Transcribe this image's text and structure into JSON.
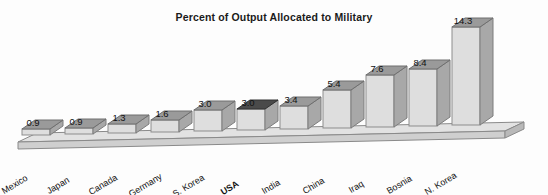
{
  "chart_data": {
    "type": "bar",
    "title": "Percent of Output Allocated to Military",
    "xlabel": "",
    "ylabel": "",
    "ylim": [
      0,
      14.3
    ],
    "grid": false,
    "legend": "none",
    "style": "3d-bar",
    "categories": [
      "Mexico",
      "Japan",
      "Canada",
      "Germany",
      "S. Korea",
      "USA",
      "India",
      "China",
      "Iraq",
      "Bosnia",
      "N. Korea"
    ],
    "values": [
      0.9,
      0.9,
      1.3,
      1.6,
      3.0,
      3.0,
      3.4,
      5.4,
      7.6,
      8.4,
      14.3
    ],
    "value_labels": [
      "0.9",
      "0.9",
      "1.3",
      "1.6",
      "3.0",
      "3.0",
      "3.4",
      "5.4",
      "7.6",
      "8.4",
      "14.3"
    ],
    "highlighted_category": "USA",
    "colors": {
      "bar_front": "#dcdcdc",
      "bar_side": "#a8a8a8",
      "bar_top": "#9a9a9a",
      "bar_top_highlight": "#4a4a4a",
      "base": "#d8d8d8",
      "text": "#111111",
      "background": "#fdfdfd"
    }
  },
  "bars": [
    {
      "label": "Mexico",
      "value_label": "0.9",
      "left": 22,
      "top": 129,
      "w": 28,
      "h": 6,
      "lx": 30,
      "ly": 117,
      "clx": 5,
      "cly": 186
    },
    {
      "label": "Japan",
      "value_label": "0.9",
      "left": 65,
      "top": 128,
      "w": 28,
      "h": 6,
      "lx": 73,
      "ly": 116,
      "clx": 50,
      "cly": 186
    },
    {
      "label": "Canada",
      "value_label": "1.3",
      "left": 108,
      "top": 124,
      "w": 28,
      "h": 9,
      "lx": 116,
      "ly": 112,
      "clx": 92,
      "cly": 187
    },
    {
      "label": "Germany",
      "value_label": "1.6",
      "left": 151,
      "top": 120,
      "w": 28,
      "h": 12,
      "lx": 159,
      "ly": 108,
      "clx": 132,
      "cly": 189
    },
    {
      "label": "S. Korea",
      "value_label": "3.0",
      "left": 194,
      "top": 110,
      "w": 28,
      "h": 21,
      "lx": 202,
      "ly": 98,
      "clx": 176,
      "cly": 189
    },
    {
      "label": "USA",
      "value_label": "3.0",
      "left": 237,
      "top": 109,
      "w": 28,
      "h": 21,
      "lx": 245,
      "ly": 97,
      "clx": 224,
      "cly": 187
    },
    {
      "label": "India",
      "value_label": "3.4",
      "left": 280,
      "top": 106,
      "w": 28,
      "h": 23,
      "lx": 288,
      "ly": 94,
      "clx": 265,
      "cly": 186
    },
    {
      "label": "China",
      "value_label": "5.4",
      "left": 323,
      "top": 90,
      "w": 28,
      "h": 38,
      "lx": 331,
      "ly": 78,
      "clx": 306,
      "cly": 186
    },
    {
      "label": "Iraq",
      "value_label": "7.6",
      "left": 366,
      "top": 75,
      "w": 28,
      "h": 52,
      "lx": 374,
      "ly": 63,
      "clx": 352,
      "cly": 185
    },
    {
      "label": "Bosnia",
      "value_label": "8.4",
      "left": 409,
      "top": 69,
      "w": 28,
      "h": 57,
      "lx": 417,
      "ly": 57,
      "clx": 390,
      "cly": 186
    },
    {
      "label": "N. Korea",
      "value_label": "14.3",
      "left": 452,
      "top": 27,
      "w": 28,
      "h": 98,
      "lx": 460,
      "ly": 15,
      "clx": 428,
      "cly": 187
    }
  ]
}
